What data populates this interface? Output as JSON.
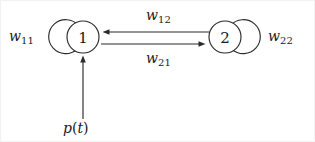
{
  "diagram": {
    "type": "recurrent-neural-network-graph",
    "title": "",
    "background_color": "#ffffff",
    "stroke_color": "#2b2b2b",
    "nodes": [
      {
        "id": "node-1",
        "label": "1",
        "cx": 82,
        "cy": 36,
        "r": 16
      },
      {
        "id": "node-2",
        "label": "2",
        "cx": 224,
        "cy": 36,
        "r": 16
      }
    ],
    "self_loops": [
      {
        "id": "loop-w11",
        "node": "node-1",
        "weight_label": "w",
        "weight_subscript": "11",
        "side": "left",
        "cx": 64,
        "cy": 36,
        "r": 17
      },
      {
        "id": "loop-w22",
        "node": "node-2",
        "weight_label": "w",
        "weight_subscript": "22",
        "side": "right",
        "cx": 243,
        "cy": 36,
        "r": 17
      }
    ],
    "edges": [
      {
        "id": "edge-w12",
        "from": "node-2",
        "to": "node-1",
        "direction": "left",
        "weight_label": "w",
        "weight_subscript": "12",
        "x1": 208,
        "y1": 31,
        "x2": 102,
        "y2": 31
      },
      {
        "id": "edge-w21",
        "from": "node-1",
        "to": "node-2",
        "direction": "right",
        "weight_label": "w",
        "weight_subscript": "21",
        "x1": 100,
        "y1": 43,
        "x2": 205,
        "y2": 43
      }
    ],
    "input": {
      "id": "input-pt",
      "target": "node-1",
      "label_var": "p",
      "label_open_paren": "(",
      "label_arg": "t",
      "label_close_paren": ")",
      "label_full": "p(t)",
      "x": 82,
      "y1": 118,
      "y2": 55
    },
    "labels": {
      "w11": {
        "base": "w",
        "sub": "11"
      },
      "w22": {
        "base": "w",
        "sub": "22"
      },
      "w12": {
        "base": "w",
        "sub": "12"
      },
      "w21": {
        "base": "w",
        "sub": "21"
      },
      "pt": {
        "var": "p",
        "open": "(",
        "arg": "t",
        "close": ")"
      }
    }
  }
}
